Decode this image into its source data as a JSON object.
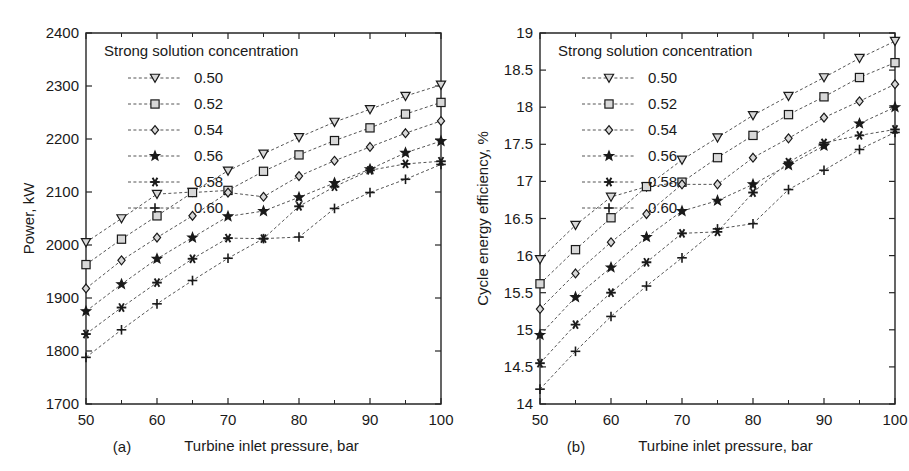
{
  "figure": {
    "background": "#ffffff",
    "line_color": "#555555",
    "marker_color": "#1a1a1a",
    "axis_color": "#262626"
  },
  "legend": {
    "title": "Strong solution concentration",
    "entries": [
      {
        "label": "0.50",
        "marker": "triangle-down-icon"
      },
      {
        "label": "0.52",
        "marker": "square-icon"
      },
      {
        "label": "0.54",
        "marker": "diamond-icon"
      },
      {
        "label": "0.56",
        "marker": "star-icon"
      },
      {
        "label": "0.58",
        "marker": "asterisk-icon"
      },
      {
        "label": "0.60",
        "marker": "plus-icon"
      }
    ]
  },
  "panels": [
    {
      "caption": "(a)",
      "chart_ref": 0
    },
    {
      "caption": "(b)",
      "chart_ref": 1
    }
  ],
  "chart_data": [
    {
      "type": "line",
      "title": "",
      "xlabel": "Turbine inlet pressure, bar",
      "ylabel": "Power, kW",
      "x": [
        50,
        55,
        60,
        65,
        70,
        75,
        80,
        85,
        90,
        95,
        100
      ],
      "xlim": [
        50,
        100
      ],
      "ylim": [
        1700,
        2400
      ],
      "xticks": [
        50,
        60,
        70,
        80,
        90,
        100
      ],
      "xticklabels": [
        "50",
        "60",
        "70",
        "80",
        "90",
        "100"
      ],
      "xminorticks": [
        55,
        65,
        75,
        85,
        95
      ],
      "yticks": [
        1700,
        1800,
        1900,
        2000,
        2100,
        2200,
        2300,
        2400
      ],
      "yticklabels": [
        "1700",
        "1800",
        "1900",
        "2000",
        "2100",
        "2200",
        "2300",
        "2400"
      ],
      "grid": false,
      "legend_position": "upper-left-inside",
      "series": [
        {
          "name": "0.50",
          "marker": "triangle-down-icon",
          "values": [
            2005,
            2050,
            2096,
            2100,
            2140,
            2172,
            2203,
            2232,
            2256,
            2281,
            2302
          ]
        },
        {
          "name": "0.52",
          "marker": "square-icon",
          "values": [
            1963,
            2011,
            2055,
            2099,
            2103,
            2139,
            2170,
            2197,
            2221,
            2247,
            2269
          ]
        },
        {
          "name": "0.54",
          "marker": "diamond-icon",
          "values": [
            1918,
            1971,
            2014,
            2055,
            2099,
            2091,
            2130,
            2159,
            2185,
            2211,
            2234
          ]
        },
        {
          "name": "0.56",
          "marker": "star-icon",
          "values": [
            1875,
            1926,
            1974,
            2014,
            2054,
            2064,
            2090,
            2117,
            2143,
            2174,
            2196
          ]
        },
        {
          "name": "0.58",
          "marker": "asterisk-icon",
          "values": [
            1832,
            1882,
            1929,
            1974,
            2013,
            2012,
            2073,
            2110,
            2141,
            2153,
            2158
          ]
        },
        {
          "name": "0.60",
          "marker": "plus-icon",
          "values": [
            1788,
            1840,
            1889,
            1933,
            1975,
            2012,
            2015,
            2069,
            2099,
            2124,
            2152
          ]
        }
      ]
    },
    {
      "type": "line",
      "title": "",
      "xlabel": "Turbine inlet pressure, bar",
      "ylabel": "Cycle energy efficiency, %",
      "x": [
        50,
        55,
        60,
        65,
        70,
        75,
        80,
        85,
        90,
        95,
        100
      ],
      "xlim": [
        50,
        100
      ],
      "ylim": [
        14,
        19
      ],
      "xticks": [
        50,
        60,
        70,
        80,
        90,
        100
      ],
      "xticklabels": [
        "50",
        "60",
        "70",
        "80",
        "90",
        "100"
      ],
      "xminorticks": [
        55,
        65,
        75,
        85,
        95
      ],
      "yticks": [
        14,
        14.5,
        15,
        15.5,
        16,
        16.5,
        17,
        17.5,
        18,
        18.5,
        19
      ],
      "yticklabels": [
        "14",
        "14.5",
        "15",
        "15.5",
        "16",
        "16.5",
        "17",
        "17.5",
        "18",
        "18.5",
        "19"
      ],
      "grid": false,
      "legend_position": "upper-left-inside",
      "series": [
        {
          "name": "0.50",
          "marker": "triangle-down-icon",
          "values": [
            15.95,
            16.41,
            16.79,
            16.93,
            17.29,
            17.59,
            17.89,
            18.15,
            18.4,
            18.66,
            18.89
          ]
        },
        {
          "name": "0.52",
          "marker": "square-icon",
          "values": [
            15.62,
            16.08,
            16.51,
            16.93,
            16.99,
            17.32,
            17.62,
            17.9,
            18.14,
            18.4,
            18.6
          ]
        },
        {
          "name": "0.54",
          "marker": "diamond-icon",
          "values": [
            15.28,
            15.76,
            16.18,
            16.56,
            16.96,
            16.96,
            17.32,
            17.58,
            17.86,
            18.08,
            18.31
          ]
        },
        {
          "name": "0.56",
          "marker": "star-icon",
          "values": [
            14.93,
            15.44,
            15.84,
            16.25,
            16.6,
            16.74,
            16.96,
            17.22,
            17.48,
            17.78,
            18.0
          ]
        },
        {
          "name": "0.58",
          "marker": "asterisk-icon",
          "values": [
            14.55,
            15.07,
            15.5,
            15.91,
            16.3,
            16.32,
            16.85,
            17.26,
            17.52,
            17.62,
            17.7
          ]
        },
        {
          "name": "0.60",
          "marker": "plus-icon",
          "values": [
            14.2,
            14.71,
            15.18,
            15.59,
            15.97,
            16.36,
            16.43,
            16.89,
            17.15,
            17.43,
            17.66
          ]
        }
      ]
    }
  ]
}
